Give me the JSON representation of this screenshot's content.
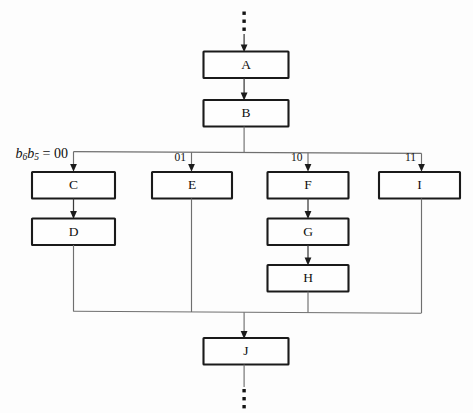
{
  "diagram": {
    "type": "flowchart",
    "background_color": "#fdfdfd",
    "box_stroke_color": "#1a1a1a",
    "line_color": "#6f6f6f",
    "arrow_color": "#1b1b1b"
  },
  "selector": {
    "expression_base": "b",
    "sub1": "6",
    "sub2": "5",
    "equals": " = ",
    "value": "00",
    "full_text": "b6b5 = 00"
  },
  "branch_labels": [
    {
      "id": "branch-00",
      "label": "b6b5 = 00",
      "value": "00"
    },
    {
      "id": "branch-01",
      "label": "01",
      "value": "01"
    },
    {
      "id": "branch-10",
      "label": "10",
      "value": "10"
    },
    {
      "id": "branch-11",
      "label": "11",
      "value": "11"
    }
  ],
  "label_01": "01",
  "label_10": "10",
  "label_11": "11",
  "boxes": [
    {
      "id": "box-a",
      "label": "A",
      "column": "trunk-top"
    },
    {
      "id": "box-b",
      "label": "B",
      "column": "trunk-top"
    },
    {
      "id": "box-c",
      "label": "C",
      "column": "branch-00"
    },
    {
      "id": "box-d",
      "label": "D",
      "column": "branch-00"
    },
    {
      "id": "box-e",
      "label": "E",
      "column": "branch-01"
    },
    {
      "id": "box-f",
      "label": "F",
      "column": "branch-10"
    },
    {
      "id": "box-g",
      "label": "G",
      "column": "branch-10"
    },
    {
      "id": "box-h",
      "label": "H",
      "column": "branch-10"
    },
    {
      "id": "box-i",
      "label": "I",
      "column": "branch-11"
    },
    {
      "id": "box-j",
      "label": "J",
      "column": "trunk-bottom"
    }
  ],
  "box_labels": {
    "a": "A",
    "b": "B",
    "c": "C",
    "d": "D",
    "e": "E",
    "f": "F",
    "g": "G",
    "h": "H",
    "i": "I",
    "j": "J"
  },
  "ellipsis": {
    "top": "⋮",
    "bottom": "⋮",
    "dot_count": 3
  },
  "flow": {
    "top_continues": true,
    "bottom_continues": true,
    "fan_out_from": "B",
    "merge_into": "J",
    "edges": [
      {
        "from": "top-ellipsis",
        "to": "A"
      },
      {
        "from": "A",
        "to": "B"
      },
      {
        "from": "B",
        "to": "fan-bus"
      },
      {
        "from": "fan-bus",
        "to": "C",
        "label": "00"
      },
      {
        "from": "fan-bus",
        "to": "E",
        "label": "01"
      },
      {
        "from": "fan-bus",
        "to": "F",
        "label": "10"
      },
      {
        "from": "fan-bus",
        "to": "I",
        "label": "11"
      },
      {
        "from": "C",
        "to": "D"
      },
      {
        "from": "F",
        "to": "G"
      },
      {
        "from": "G",
        "to": "H"
      },
      {
        "from": "D",
        "to": "merge-bus"
      },
      {
        "from": "E",
        "to": "merge-bus"
      },
      {
        "from": "H",
        "to": "merge-bus"
      },
      {
        "from": "I",
        "to": "merge-bus"
      },
      {
        "from": "merge-bus",
        "to": "J"
      },
      {
        "from": "J",
        "to": "bottom-ellipsis"
      }
    ]
  }
}
